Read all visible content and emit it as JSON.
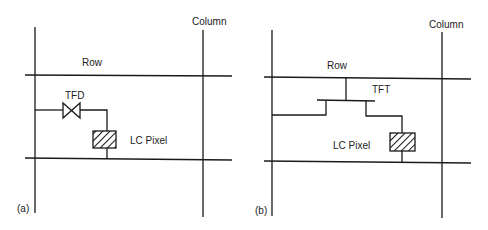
{
  "panels": [
    {
      "id": "a",
      "tag": "(a)",
      "row_label": "Row",
      "column_label": "Column",
      "device_label": "TFD",
      "pixel_label": "LC Pixel"
    },
    {
      "id": "b",
      "tag": "(b)",
      "row_label": "Row",
      "column_label": "Column",
      "device_label": "TFT",
      "pixel_label": "LC Pixel"
    }
  ],
  "colors": {
    "line": "#1a1a1a",
    "text": "#222222",
    "background": "#ffffff"
  }
}
